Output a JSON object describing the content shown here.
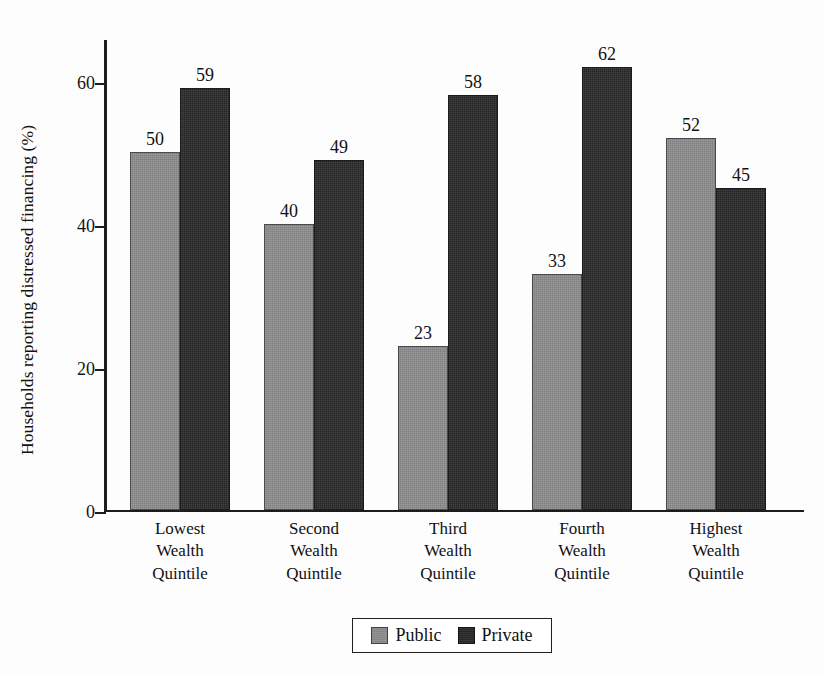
{
  "chart_data": {
    "type": "bar",
    "title": "",
    "xlabel": "",
    "ylabel": "Households reporting distressed financing (%)",
    "categories": [
      "Lowest Wealth Quintile",
      "Second Wealth Quintile",
      "Third Wealth Quintile",
      "Fourth Wealth Quintile",
      "Highest Wealth Quintile"
    ],
    "category_lines": [
      [
        "Lowest",
        "Wealth",
        "Quintile"
      ],
      [
        "Second",
        "Wealth",
        "Quintile"
      ],
      [
        "Third",
        "Wealth",
        "Quintile"
      ],
      [
        "Fourth",
        "Wealth",
        "Quintile"
      ],
      [
        "Highest",
        "Wealth",
        "Quintile"
      ]
    ],
    "series": [
      {
        "name": "Public",
        "color": "#8d8d8d",
        "values": [
          50,
          40,
          23,
          33,
          52
        ]
      },
      {
        "name": "Private",
        "color": "#2a2a2a",
        "values": [
          59,
          49,
          58,
          62,
          45
        ]
      }
    ],
    "ylim": [
      0,
      66
    ],
    "yticks": [
      0,
      20,
      40,
      60
    ],
    "ytick_labels": [
      "0",
      "20",
      "40",
      "60"
    ],
    "grid": false,
    "legend_position": "bottom-center",
    "data_labels": true
  },
  "legend": {
    "items": [
      {
        "label": "Public",
        "color": "#8d8d8d"
      },
      {
        "label": "Private",
        "color": "#2a2a2a"
      }
    ]
  },
  "axis": {
    "y_title": "Households reporting distressed financing (%)"
  }
}
